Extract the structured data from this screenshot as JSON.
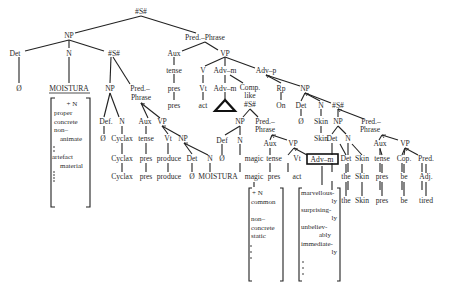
{
  "diagram": {
    "type": "syntax-tree",
    "root": "#S#",
    "labels": {
      "root_s": "#S#",
      "np_main": "NP",
      "pred_phrase_main": "Pred.–Phrase",
      "det_main": "Det",
      "n_main": "N",
      "s_rel1": "#S#",
      "aux_main": "Aux",
      "vp_main": "VP",
      "null_main": "Ø",
      "moistura_main": "MOISTURA",
      "np_rel1": "NP",
      "pred_rel1_a": "Pred.–",
      "pred_rel1_b": "Phrase",
      "tense_main": "tense",
      "pres_main1": "pres",
      "pres_main2": "pres",
      "v_main": "V",
      "advm_main": "Adv–m",
      "advp_main": "Adv–p",
      "vt_main": "Vt",
      "advm_main2": "Adv–m",
      "comp_a": "Comp.",
      "comp_b": "like",
      "comp_c": "#S#",
      "rp_main": "Rp",
      "np_advp": "NP",
      "act_main": "act",
      "on_main": "On",
      "det_advp": "Det",
      "n_advp": "N",
      "s_rel3": "#S#",
      "null_advp": "Ø",
      "skin_advp1": "Skin",
      "skin_advp2": "Skin",
      "def_rel1": "Def.",
      "n_rel1": "N",
      "aux_rel1": "Aux",
      "vp_rel1": "VP",
      "null_rel1": "Ø",
      "cyclax_rel1": "Cyclax",
      "tense_rel1": "tense",
      "vt_rel1": "Vt",
      "np_obj_rel1": "NP",
      "cyclax_rel1_b": "Cyclax",
      "pres_rel1_a": "pres",
      "produce_rel1_a": "produce",
      "det_obj_rel1": "Det",
      "n_obj_rel1": "N",
      "cyclax_rel1_c": "Cyclax",
      "pres_rel1_b": "pres",
      "produce_rel1_b": "produce",
      "null_obj_rel1": "Ø",
      "moistura_obj_rel1": "MOISTURA",
      "np_rel2": "NP",
      "pred_rel2_a": "Pred.–",
      "pred_rel2_b": "Phrase",
      "def_rel2": "Def",
      "n_rel2": "N",
      "aux_rel2": "Aux",
      "vp_rel2": "VP",
      "null_rel2": "Ø",
      "magic_rel2_a": "magic",
      "tense_rel2": "tense",
      "vt_rel2": "Vt",
      "advm_rel2_box": "Adv–m",
      "magic_rel2_b": "magic",
      "pres_rel2": "pres",
      "act_rel2": "act",
      "np_rel3": "NP",
      "pred_rel3_a": "Pred.–",
      "pred_rel3_b": "Phrase",
      "det_rel3": "Det",
      "n_rel3": "N",
      "aux_rel3": "Aux",
      "vp_rel3": "VP",
      "det_rel3_b": "Det",
      "skin_rel3_a": "Skin",
      "tense_rel3": "tense",
      "cop_rel3": "Cop.",
      "pred_adj_rel3": "Pred.",
      "the_rel3_a": "the",
      "skin_rel3_b": "Skin",
      "pres_rel3_a": "pres",
      "be_rel3_a": "be",
      "adj_rel3": "Adj.",
      "the_rel3_b": "the",
      "skin_rel3_c": "Skin",
      "pres_rel3_b": "pres",
      "be_rel3_b": "be",
      "tired_rel3": "tired"
    },
    "feature_matrices": {
      "moistura": [
        "+ N",
        "proper",
        "concrete",
        "non–",
        "animate",
        "artefact",
        "material"
      ],
      "magic": [
        "+ N",
        "common",
        "non–",
        "concrete",
        "static"
      ],
      "adv_m": [
        "marvellous-",
        "ly",
        "surprising-",
        "ly",
        "unbeliev-",
        "ably",
        "immediate-",
        "ly"
      ]
    },
    "colors": {
      "ink": "#222222",
      "background": "#ffffff"
    }
  }
}
